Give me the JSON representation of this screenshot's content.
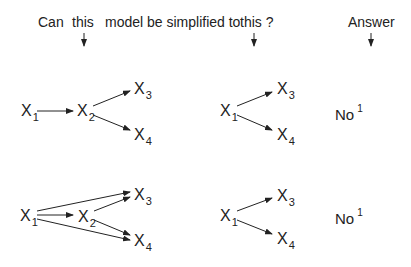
{
  "header": {
    "can": "Can",
    "this1": "this",
    "middle": "model be simplified to",
    "this2": "this ?",
    "answer": "Answer"
  },
  "rows": [
    {
      "original": {
        "nodes": [
          {
            "id": "X1",
            "label": "X",
            "sub": "1"
          },
          {
            "id": "X2",
            "label": "X",
            "sub": "2"
          },
          {
            "id": "X3",
            "label": "X",
            "sub": "3"
          },
          {
            "id": "X4",
            "label": "X",
            "sub": "4"
          }
        ],
        "edges": [
          [
            "X1",
            "X2"
          ],
          [
            "X2",
            "X3"
          ],
          [
            "X2",
            "X4"
          ]
        ]
      },
      "simplified": {
        "nodes": [
          {
            "id": "X1",
            "label": "X",
            "sub": "1"
          },
          {
            "id": "X3",
            "label": "X",
            "sub": "3"
          },
          {
            "id": "X4",
            "label": "X",
            "sub": "4"
          }
        ],
        "edges": [
          [
            "X1",
            "X3"
          ],
          [
            "X1",
            "X4"
          ]
        ]
      },
      "answer": "No",
      "footnote": "1"
    },
    {
      "original": {
        "nodes": [
          {
            "id": "X1",
            "label": "X",
            "sub": "1"
          },
          {
            "id": "X2",
            "label": "X",
            "sub": "2"
          },
          {
            "id": "X3",
            "label": "X",
            "sub": "3"
          },
          {
            "id": "X4",
            "label": "X",
            "sub": "4"
          }
        ],
        "edges": [
          [
            "X1",
            "X2"
          ],
          [
            "X1",
            "X3"
          ],
          [
            "X1",
            "X4"
          ],
          [
            "X2",
            "X3"
          ],
          [
            "X2",
            "X4"
          ]
        ]
      },
      "simplified": {
        "nodes": [
          {
            "id": "X1",
            "label": "X",
            "sub": "1"
          },
          {
            "id": "X3",
            "label": "X",
            "sub": "3"
          },
          {
            "id": "X4",
            "label": "X",
            "sub": "4"
          }
        ],
        "edges": [
          [
            "X1",
            "X3"
          ],
          [
            "X1",
            "X4"
          ]
        ]
      },
      "answer": "No",
      "footnote": "1"
    }
  ],
  "colors": {
    "ink": "#222222",
    "background": "#ffffff"
  }
}
